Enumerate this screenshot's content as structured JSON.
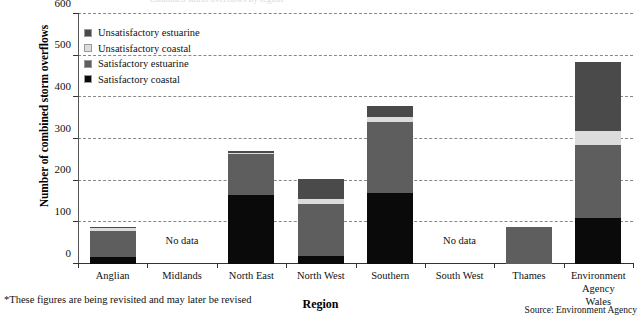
{
  "figure": {
    "cutoff_title": "combined storm overflows by region",
    "footnote": "*These figures are being revisited and may later be revised",
    "source": "Source: Environment Agency"
  },
  "legend": {
    "position": "inside-top-left",
    "items": [
      {
        "label": "Unsatisfactory estuarine",
        "color": "#4a4a4a",
        "key": "unsat_estuarine"
      },
      {
        "label": "Unsatisfactory coastal",
        "color": "#dcdcdc",
        "key": "unsat_coastal"
      },
      {
        "label": "Satisfactory estuarine",
        "color": "#5e5e5e",
        "key": "sat_estuarine"
      },
      {
        "label": "Satisfactory coastal",
        "color": "#0a0a0a",
        "key": "sat_coastal"
      }
    ]
  },
  "chart_data": {
    "type": "bar",
    "subtype": "stacked-vertical",
    "title": "",
    "xlabel": "Region",
    "ylabel": "Number of combined storm overflows",
    "ylim": [
      0,
      600
    ],
    "yticks": [
      0,
      100,
      200,
      300,
      400,
      500,
      600
    ],
    "ytick_labels": [
      "0",
      "100",
      "200",
      "300",
      "400",
      "500",
      "600"
    ],
    "grid": "horizontal-dashed",
    "categories": [
      "Anglian",
      "Midlands",
      "North East",
      "North West",
      "Southern",
      "South West",
      "Thames",
      "Environment\nAgency Wales"
    ],
    "series": [
      {
        "name": "Satisfactory coastal",
        "color": "#0a0a0a",
        "values": [
          18,
          null,
          165,
          20,
          170,
          null,
          0,
          110
        ]
      },
      {
        "name": "Satisfactory estuarine",
        "color": "#5e5e5e",
        "values": [
          62,
          null,
          98,
          125,
          172,
          null,
          90,
          175
        ]
      },
      {
        "name": "Unsatisfactory coastal",
        "color": "#dcdcdc",
        "values": [
          8,
          null,
          4,
          10,
          10,
          null,
          0,
          35
        ]
      },
      {
        "name": "Unsatisfactory estuarine",
        "color": "#4a4a4a",
        "values": [
          2,
          null,
          5,
          50,
          28,
          null,
          0,
          165
        ]
      }
    ],
    "totals": [
      90,
      null,
      272,
      205,
      380,
      null,
      90,
      485
    ],
    "no_data_categories": [
      "Midlands",
      "South West"
    ],
    "no_data_label": "No data"
  }
}
